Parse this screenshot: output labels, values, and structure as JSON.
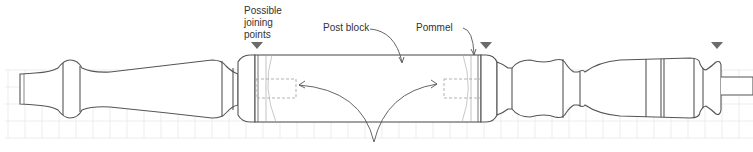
{
  "diagram": {
    "colors": {
      "outline": "#555555",
      "grid": "#e6e6e6",
      "marker": "#6b6b6b",
      "text": "#333333",
      "hidden_line": "#9a9a9a"
    },
    "labels": {
      "joining_points": "Possible\njoining\npoints",
      "post_block": "Post block",
      "pommel": "Pommel"
    },
    "markers": [
      {
        "name": "joining-point-left",
        "x": 257,
        "y": 47
      },
      {
        "name": "joining-point-middle",
        "x": 486,
        "y": 47
      },
      {
        "name": "joining-point-right",
        "x": 717,
        "y": 47
      }
    ]
  }
}
